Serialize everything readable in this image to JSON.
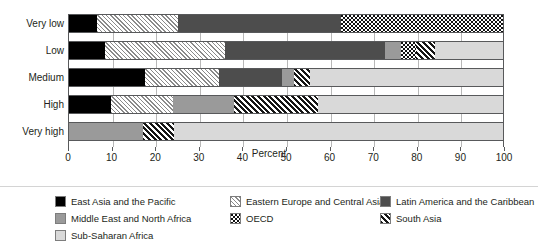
{
  "chart_data": {
    "type": "bar",
    "orientation": "horizontal",
    "stacked": true,
    "title": "",
    "xlabel": "Percent",
    "ylabel": "",
    "xlim": [
      0,
      100
    ],
    "xticks": [
      0,
      10,
      20,
      30,
      40,
      50,
      60,
      70,
      80,
      90,
      100
    ],
    "xticklabels": [
      "0",
      "10",
      "20",
      "30",
      "40",
      "50",
      "60",
      "70",
      "80",
      "90",
      "100"
    ],
    "grid": true,
    "grid_axis": "x",
    "legend_position": "bottom",
    "categories": [
      "Very low",
      "Low",
      "Medium",
      "High",
      "Very high"
    ],
    "series": [
      {
        "name": "East Asia and the Pacific",
        "key": "eap",
        "pattern": "solid-black",
        "color": "#000000",
        "values": [
          6.5,
          8.4,
          17.4,
          9.6,
          0
        ]
      },
      {
        "name": "Eastern Europe and Central Asia",
        "key": "eeca",
        "pattern": "fine-hatch",
        "color": "#e8e8e8",
        "values": [
          18.7,
          27.6,
          17.2,
          14.4,
          0
        ]
      },
      {
        "name": "Latin America and the Caribbean",
        "key": "lac",
        "pattern": "solid-dark-gray",
        "color": "#4d4d4d",
        "values": [
          37.5,
          36.7,
          14.4,
          0,
          0
        ]
      },
      {
        "name": "Middle East and North Africa",
        "key": "mena",
        "pattern": "solid-mid-gray",
        "color": "#9a9a9a",
        "values": [
          0,
          3.8,
          2.8,
          14.0,
          17.0
        ]
      },
      {
        "name": "OECD",
        "key": "oecd",
        "pattern": "checkerboard",
        "color": "#111111",
        "values": [
          37.3,
          3.5,
          0,
          0,
          0
        ]
      },
      {
        "name": "South Asia",
        "key": "sa",
        "pattern": "bold-hatch",
        "color": "#151515",
        "values": [
          0,
          4.3,
          3.8,
          19.3,
          7.3
        ]
      },
      {
        "name": "Sub-Saharan Africa",
        "key": "ssa",
        "pattern": "solid-light-gray",
        "color": "#d9d9d9",
        "values": [
          0,
          15.7,
          44.4,
          42.7,
          75.7
        ]
      }
    ]
  },
  "axis": {
    "x_title": "Percent",
    "ticks": [
      "0",
      "10",
      "20",
      "30",
      "40",
      "50",
      "60",
      "70",
      "80",
      "90",
      "100"
    ],
    "row_labels": [
      "Very low",
      "Low",
      "Medium",
      "High",
      "Very high"
    ]
  },
  "legend": {
    "items": [
      {
        "label": "East Asia and the Pacific",
        "key": "eap"
      },
      {
        "label": "Eastern Europe and Central Asia",
        "key": "eeca"
      },
      {
        "label": "Latin America and the Caribbean",
        "key": "lac"
      },
      {
        "label": "Middle East and North Africa",
        "key": "mena"
      },
      {
        "label": "OECD",
        "key": "oecd"
      },
      {
        "label": "South Asia",
        "key": "sa"
      },
      {
        "label": "Sub-Saharan Africa",
        "key": "ssa"
      }
    ]
  }
}
